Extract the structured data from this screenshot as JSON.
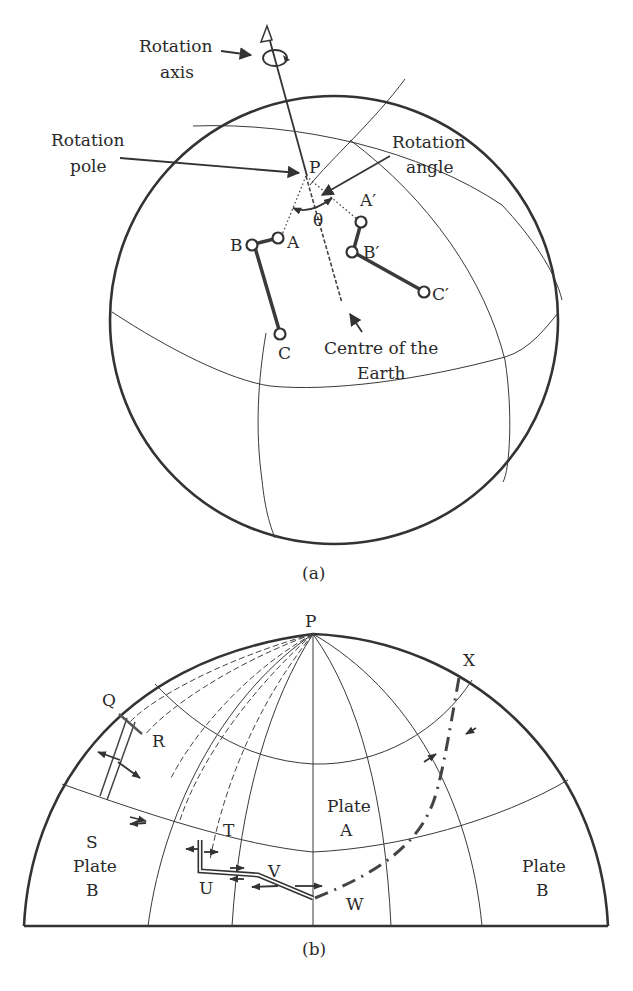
{
  "figure": {
    "panel_a": {
      "caption": "(a)",
      "labels": {
        "rotation_axis_line1": "Rotation",
        "rotation_axis_line2": "axis",
        "rotation_pole_line1": "Rotation",
        "rotation_pole_line2": "pole",
        "rotation_angle_line1": "Rotation",
        "rotation_angle_line2": "angle",
        "pole": "P",
        "theta": "θ",
        "A": "A",
        "B": "B",
        "C": "C",
        "A_prime": "A′",
        "B_prime": "B′",
        "C_prime": "C′",
        "centre_line1": "Centre of the",
        "centre_line2": "Earth"
      }
    },
    "panel_b": {
      "caption": "(b)",
      "labels": {
        "pole": "P",
        "Q": "Q",
        "R": "R",
        "S": "S",
        "T": "T",
        "U": "U",
        "V": "V",
        "W": "W",
        "X": "X",
        "plate_left_line1": "Plate",
        "plate_left_line2": "B",
        "plate_center_line1": "Plate",
        "plate_center_line2": "A",
        "plate_right_line1": "Plate",
        "plate_right_line2": "B"
      }
    },
    "colors": {
      "ink": "#333333",
      "background": "#ffffff"
    }
  }
}
